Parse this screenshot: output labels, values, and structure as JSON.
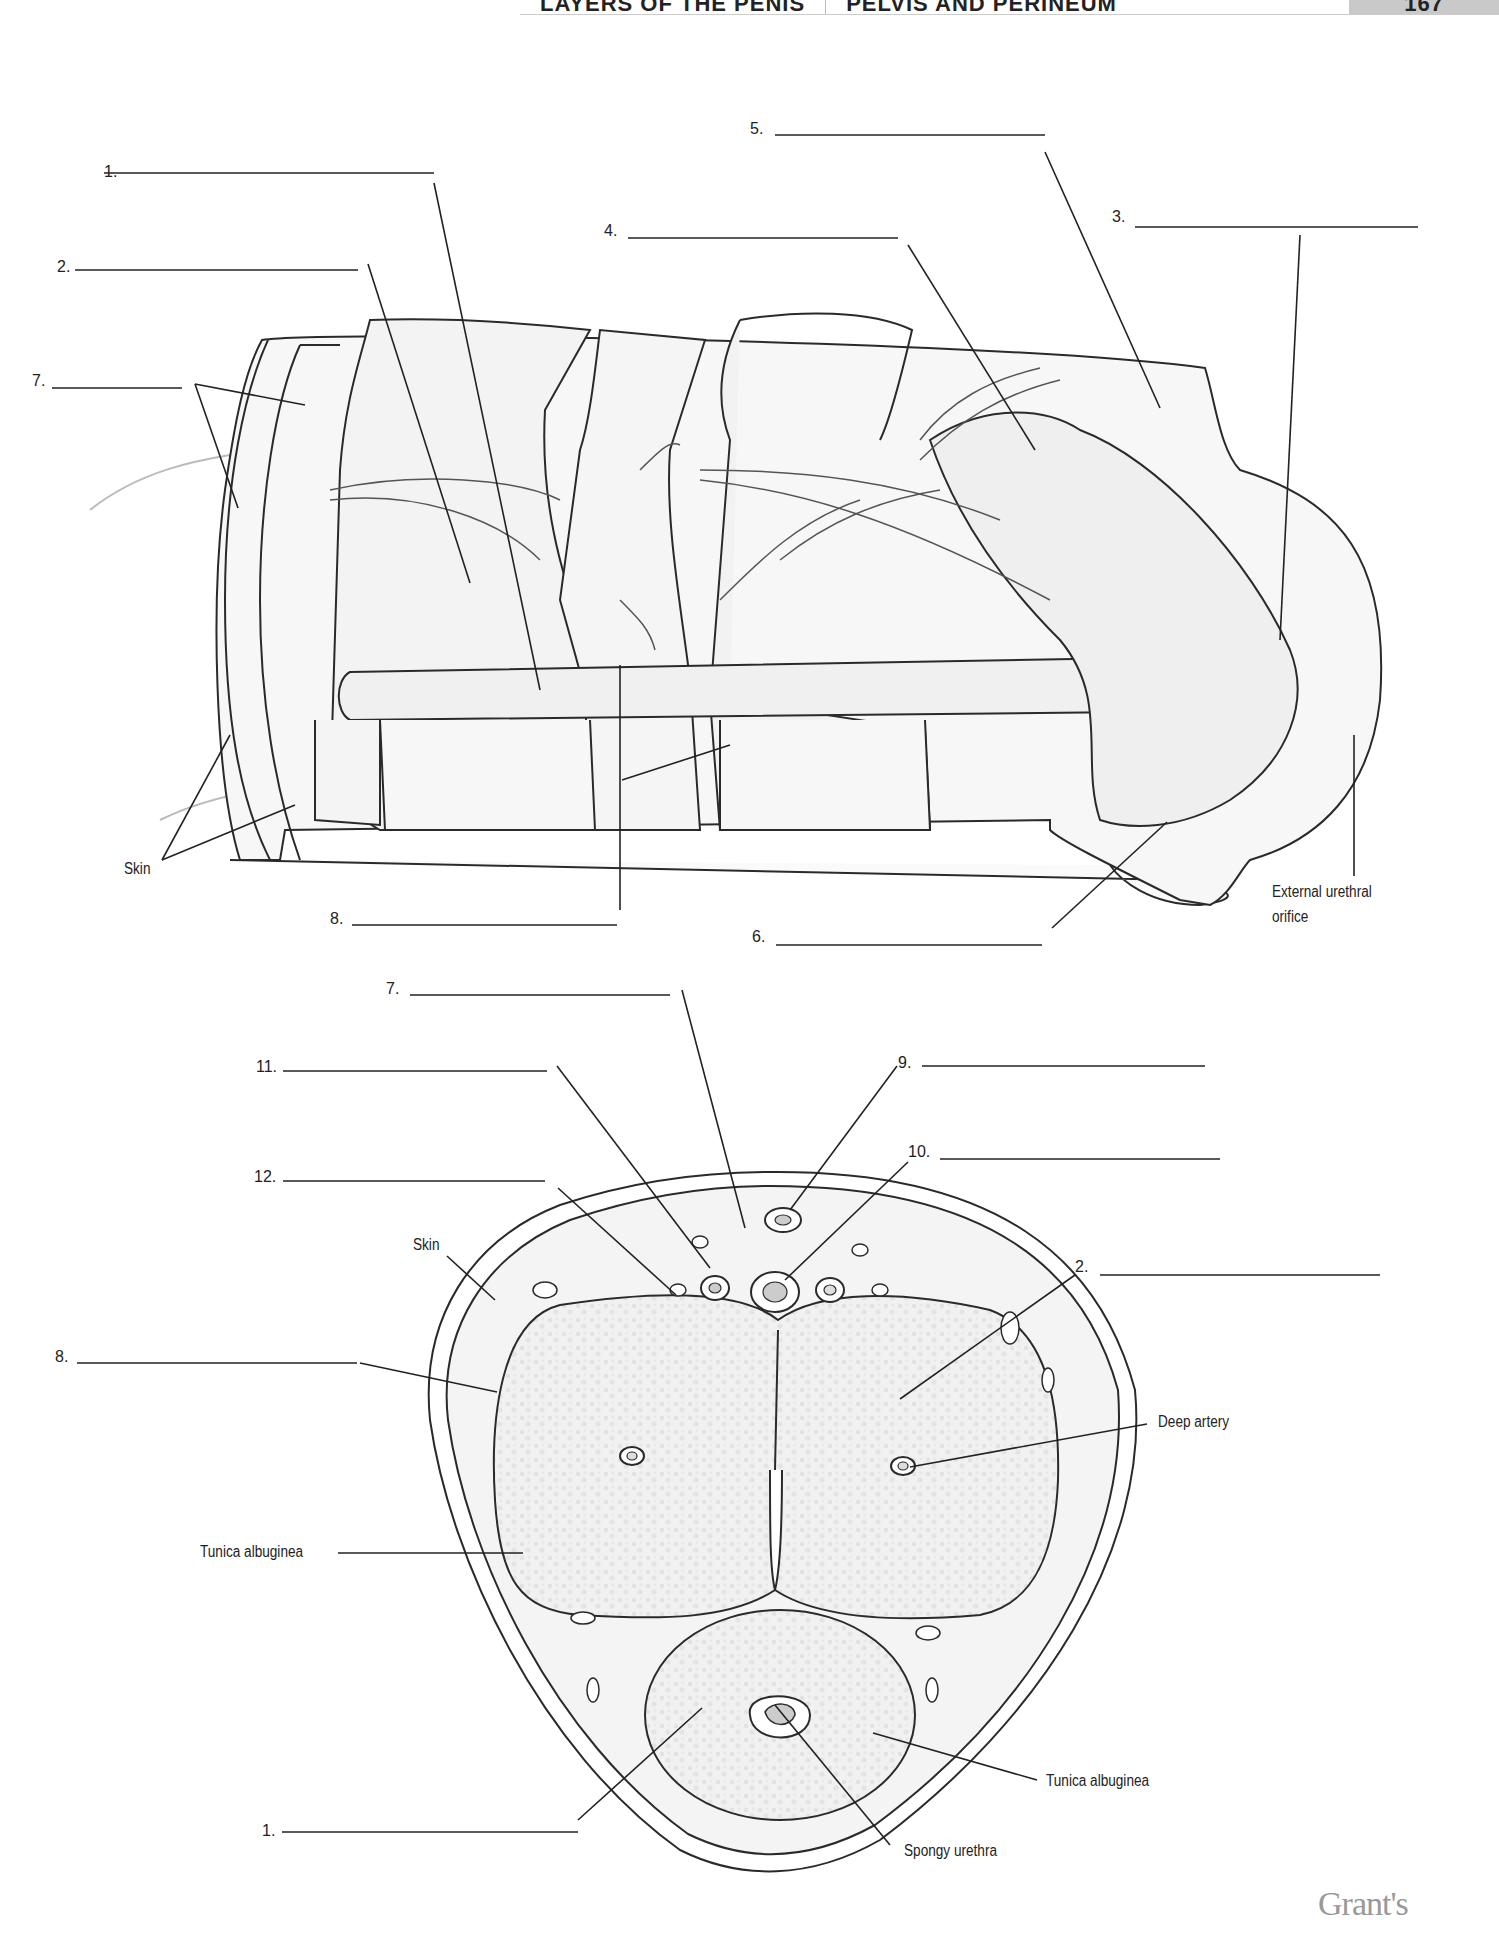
{
  "header": {
    "section": "LAYERS OF THE PENIS",
    "chapter": "PELVIS AND PERINEUM",
    "page": "167"
  },
  "figure_top": {
    "blanks": [
      {
        "num": "1.",
        "x": 86,
        "y": 163
      },
      {
        "num": "2.",
        "x": 57,
        "y": 258
      },
      {
        "num": "3.",
        "x": 1112,
        "y": 208
      },
      {
        "num": "4.",
        "x": 604,
        "y": 222
      },
      {
        "num": "5.",
        "x": 750,
        "y": 120
      },
      {
        "num": "6.",
        "x": 752,
        "y": 928
      },
      {
        "num": "7.",
        "x": 32,
        "y": 372
      },
      {
        "num": "8.",
        "x": 330,
        "y": 910
      }
    ],
    "labels": {
      "skin": "Skin",
      "external_urethral_orifice_1": "External urethral",
      "external_urethral_orifice_2": "orifice"
    }
  },
  "figure_bottom": {
    "blanks": [
      {
        "num": "7.",
        "x": 386,
        "y": 980
      },
      {
        "num": "11.",
        "x": 256,
        "y": 1058
      },
      {
        "num": "9.",
        "x": 898,
        "y": 1054
      },
      {
        "num": "10.",
        "x": 908,
        "y": 1143
      },
      {
        "num": "12.",
        "x": 254,
        "y": 1168
      },
      {
        "num": "2.",
        "x": 1072,
        "y": 1258
      },
      {
        "num": "8.",
        "x": 55,
        "y": 1348
      },
      {
        "num": "1.",
        "x": 262,
        "y": 1822
      }
    ],
    "labels": {
      "skin": "Skin",
      "deep_artery": "Deep artery",
      "tunica_albuginea_left": "Tunica albuginea",
      "tunica_albuginea_right": "Tunica albuginea",
      "spongy_urethra": "Spongy urethra"
    }
  },
  "footer": {
    "brand": "Grant's"
  }
}
